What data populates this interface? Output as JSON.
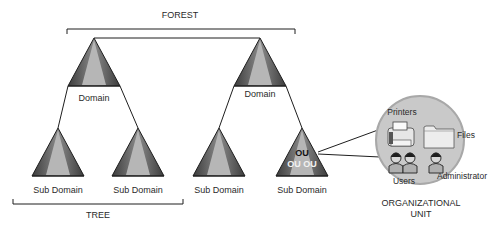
{
  "diagram": {
    "forest_label": "FOREST",
    "tree_label": "TREE",
    "domains": [
      {
        "label": "Domain"
      },
      {
        "label": "Domain"
      }
    ],
    "sub_domains": [
      {
        "label": "Sub Domain"
      },
      {
        "label": "Sub Domain"
      },
      {
        "label": "Sub Domain"
      },
      {
        "label": "Sub Domain",
        "ou_top": "OU",
        "ou_bottom": "OU OU"
      }
    ],
    "organizational_unit": {
      "title_line1": "ORGANIZATIONAL",
      "title_line2": "UNIT",
      "items": {
        "printers": "Printers",
        "files": "Files",
        "users": "Users",
        "administrator": "Administrator"
      }
    },
    "colors": {
      "triangle_dark": "#4a4a4a",
      "triangle_mid": "#7a7a7a",
      "triangle_light": "#b4b4b4",
      "circle_fill": "#c9c9c9",
      "circle_stroke": "#a8a8a8",
      "line": "#1e1e1e"
    }
  }
}
